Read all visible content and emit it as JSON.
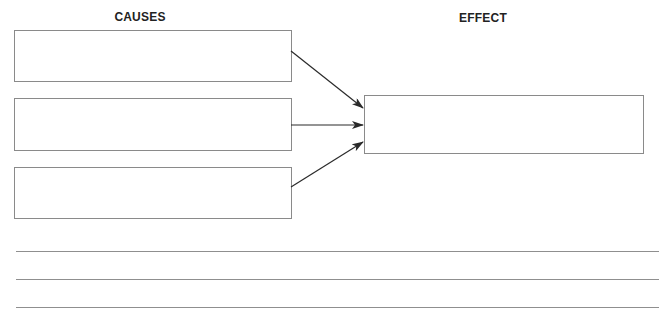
{
  "diagram": {
    "type": "cause-and-effect organizer",
    "causes_heading": "CAUSES",
    "effect_heading": "EFFECT",
    "causes": [
      {
        "text": ""
      },
      {
        "text": ""
      },
      {
        "text": ""
      }
    ],
    "effect": {
      "text": ""
    },
    "arrows": [
      {
        "from": "cause-1",
        "to": "effect"
      },
      {
        "from": "cause-2",
        "to": "effect"
      },
      {
        "from": "cause-3",
        "to": "effect"
      }
    ],
    "writing_lines": [
      {
        "text": ""
      },
      {
        "text": ""
      },
      {
        "text": ""
      }
    ]
  },
  "colors": {
    "box_border": "#8a8a8a",
    "arrow": "#2a2a2a",
    "rule_line": "#8f8f8f",
    "heading_text": "#222222"
  }
}
